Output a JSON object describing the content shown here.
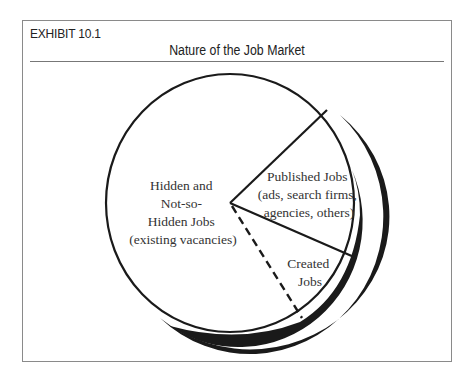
{
  "exhibit": {
    "label": "EXHIBIT 10.1",
    "title": "Nature of the Job Market"
  },
  "diagram": {
    "type": "pie-diagram",
    "slices": [
      {
        "id": "hidden",
        "lines": [
          "Hidden and",
          "Not-so-",
          "Hidden Jobs",
          "(existing vacancies)"
        ]
      },
      {
        "id": "published",
        "lines": [
          "Published Jobs",
          "(ads, search firms,",
          "agencies, others)"
        ]
      },
      {
        "id": "created",
        "lines": [
          "Created",
          "Jobs"
        ]
      }
    ],
    "dividers": [
      {
        "style": "solid",
        "between": [
          "hidden",
          "published"
        ]
      },
      {
        "style": "solid",
        "between": [
          "published",
          "created"
        ]
      },
      {
        "style": "dashed",
        "between": [
          "created",
          "hidden"
        ]
      }
    ],
    "colors": {
      "stroke": "#1a1a1a",
      "shadow": "#1a1a1a",
      "text": "#333333",
      "frame": "#8a8a8a"
    }
  }
}
